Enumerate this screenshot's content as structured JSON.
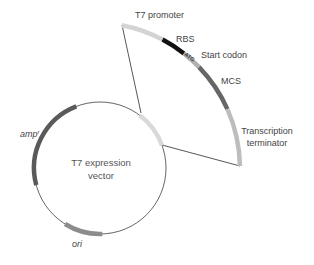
{
  "plasmid": {
    "name_line1": "T7 expression",
    "name_line2": "vector",
    "backbone_color": "#555555",
    "features": [
      {
        "id": "insert-region",
        "label": "",
        "color": "#d9d9d9"
      },
      {
        "id": "amp",
        "label": "amp",
        "superscript": "r",
        "color": "#5a5a5a"
      },
      {
        "id": "ori",
        "label": "ori",
        "color": "#8c8c8c"
      }
    ]
  },
  "expanded_region": {
    "features": [
      {
        "id": "t7-promoter",
        "label": "T7 promoter",
        "color": "#d4d4d4"
      },
      {
        "id": "rbs",
        "label": "RBS",
        "color": "#111111"
      },
      {
        "id": "start-codon",
        "label": "Start codon",
        "sequence": "ATG",
        "color": "#b0b0b0"
      },
      {
        "id": "mcs",
        "label": "MCS",
        "color": "#666666"
      },
      {
        "id": "terminator",
        "label_line1": "Transcription",
        "label_line2": "terminator",
        "color": "#bdbdbd"
      }
    ]
  }
}
